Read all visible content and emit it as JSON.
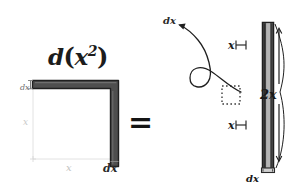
{
  "figure": {
    "title_main": "d",
    "title_open": "(",
    "title_var": "x",
    "title_exp": "2",
    "title_close": ")",
    "equals": "="
  },
  "left_figure": {
    "label_dx_top": "dx",
    "label_x_vertical": "x",
    "label_x_horizontal": "x",
    "label_dx_right": "dx"
  },
  "right_figure": {
    "label_dx_callout": "dx",
    "label_x_upper": "x",
    "label_x_lower": "x",
    "label_2x": "2x",
    "label_dx_base": "dx"
  },
  "colors": {
    "ink": "#1c1c1c",
    "bar_outline": "#232323",
    "bar_fill": "#9a9a9a",
    "lshape_fill": "#4a4a4a",
    "faint_guide": "#d0d0d0",
    "background": "#ffffff"
  }
}
